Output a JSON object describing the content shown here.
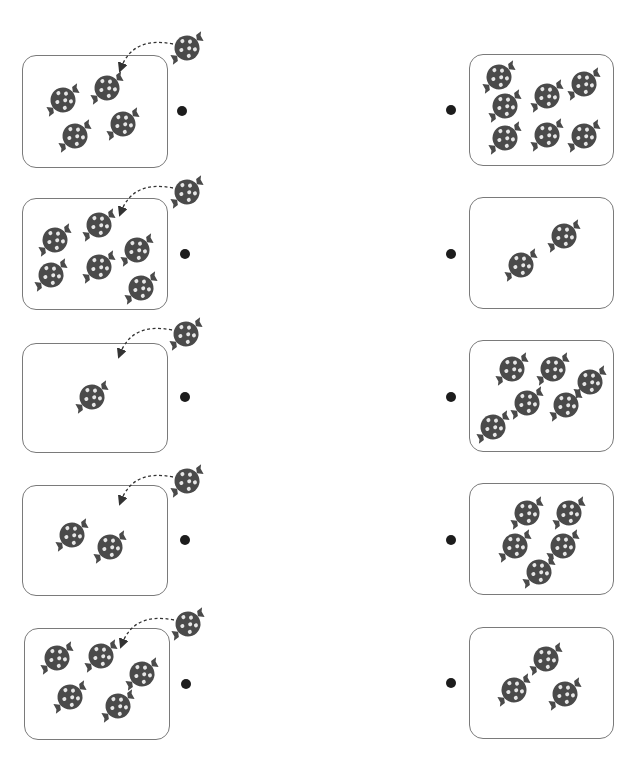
{
  "worksheet": {
    "header_text": "",
    "candy_color": "#4a4a4a",
    "candy_spot_color": "#e6e6e6",
    "box_border_color": "#7a7a7a",
    "dot_color": "#1c1c1c",
    "instruction": "Match each left box (with one more candy added) to the right box with the same total"
  },
  "left_items": [
    {
      "count": 4,
      "plus": 1,
      "box": [
        22,
        55,
        146,
        113
      ],
      "candies": [
        [
          63,
          100
        ],
        [
          107,
          88
        ],
        [
          75,
          136
        ],
        [
          123,
          124
        ]
      ],
      "extra_candy": [
        187,
        48
      ],
      "dot": [
        182,
        111
      ]
    },
    {
      "count": 6,
      "plus": 1,
      "box": [
        22,
        198,
        146,
        112
      ],
      "candies": [
        [
          55,
          240
        ],
        [
          99,
          225
        ],
        [
          137,
          250
        ],
        [
          51,
          275
        ],
        [
          99,
          267
        ],
        [
          141,
          288
        ]
      ],
      "extra_candy": [
        187,
        192
      ],
      "dot": [
        185,
        254
      ]
    },
    {
      "count": 1,
      "plus": 1,
      "box": [
        22,
        343,
        146,
        110
      ],
      "candies": [
        [
          92,
          397
        ]
      ],
      "extra_candy": [
        186,
        334
      ],
      "dot": [
        185,
        397
      ]
    },
    {
      "count": 2,
      "plus": 1,
      "box": [
        22,
        485,
        146,
        111
      ],
      "candies": [
        [
          72,
          535
        ],
        [
          110,
          547
        ]
      ],
      "extra_candy": [
        187,
        481
      ],
      "dot": [
        185,
        540
      ]
    },
    {
      "count": 5,
      "plus": 1,
      "box": [
        24,
        628,
        146,
        112
      ],
      "candies": [
        [
          57,
          658
        ],
        [
          101,
          656
        ],
        [
          142,
          674
        ],
        [
          70,
          697
        ],
        [
          118,
          706
        ]
      ],
      "extra_candy": [
        188,
        624
      ],
      "dot": [
        186,
        684
      ]
    }
  ],
  "right_items": [
    {
      "count": 7,
      "box": [
        469,
        54,
        145,
        112
      ],
      "candies": [
        [
          499,
          77
        ],
        [
          547,
          96
        ],
        [
          584,
          84
        ],
        [
          505,
          106
        ],
        [
          547,
          135
        ],
        [
          584,
          136
        ],
        [
          505,
          138
        ]
      ],
      "dot": [
        451,
        110
      ]
    },
    {
      "count": 2,
      "box": [
        469,
        197,
        145,
        112
      ],
      "candies": [
        [
          564,
          236
        ],
        [
          521,
          265
        ]
      ],
      "dot": [
        451,
        254
      ]
    },
    {
      "count": 6,
      "box": [
        469,
        340,
        145,
        112
      ],
      "candies": [
        [
          512,
          369
        ],
        [
          553,
          369
        ],
        [
          590,
          382
        ],
        [
          527,
          403
        ],
        [
          566,
          405
        ],
        [
          493,
          427
        ]
      ],
      "dot": [
        451,
        397
      ]
    },
    {
      "count": 5,
      "box": [
        469,
        483,
        145,
        112
      ],
      "candies": [
        [
          527,
          513
        ],
        [
          569,
          513
        ],
        [
          515,
          546
        ],
        [
          563,
          546
        ],
        [
          539,
          572
        ]
      ],
      "dot": [
        451,
        540
      ]
    },
    {
      "count": 3,
      "box": [
        469,
        627,
        145,
        112
      ],
      "candies": [
        [
          546,
          659
        ],
        [
          514,
          690
        ],
        [
          565,
          694
        ]
      ],
      "dot": [
        451,
        683
      ]
    }
  ]
}
